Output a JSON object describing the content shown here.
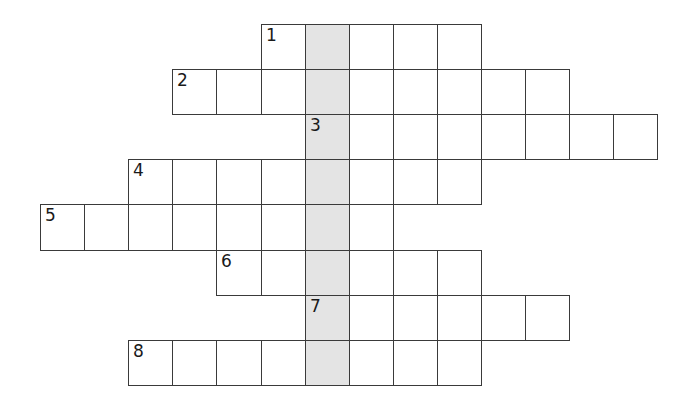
{
  "puzzle": {
    "type": "crossword",
    "grid_origin": {
      "x": 40,
      "y": 24
    },
    "cell_size": {
      "w": 44.1,
      "h": 45.1
    },
    "shaded_column": 6,
    "colors": {
      "border": "#3a3a3a",
      "cell": "#ffffff",
      "shaded": "#e4e4e4",
      "number": "#1a1a1a"
    },
    "rows": [
      {
        "clue_number": "1",
        "row": 0,
        "start_col": 5,
        "length": 5
      },
      {
        "clue_number": "2",
        "row": 1,
        "start_col": 3,
        "length": 9
      },
      {
        "clue_number": "3",
        "row": 2,
        "start_col": 6,
        "length": 8
      },
      {
        "clue_number": "4",
        "row": 3,
        "start_col": 2,
        "length": 8
      },
      {
        "clue_number": "5",
        "row": 4,
        "start_col": 0,
        "length": 8
      },
      {
        "clue_number": "6",
        "row": 5,
        "start_col": 4,
        "length": 6
      },
      {
        "clue_number": "7",
        "row": 6,
        "start_col": 6,
        "length": 6
      },
      {
        "clue_number": "8",
        "row": 7,
        "start_col": 2,
        "length": 8
      }
    ]
  }
}
